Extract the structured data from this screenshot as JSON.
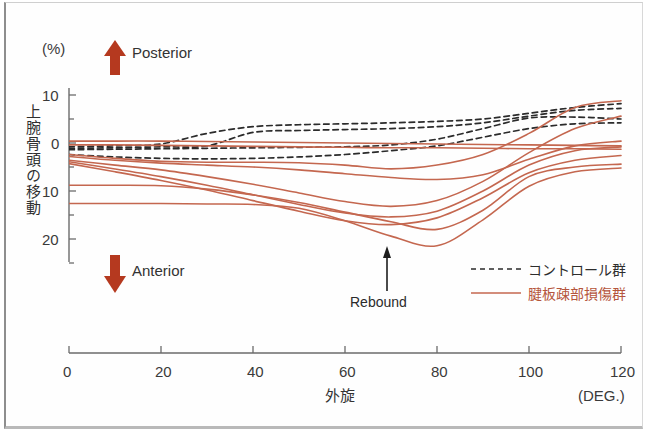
{
  "figure": {
    "unit_label": "(%)",
    "y_axis_title": "上腕骨頭の移動",
    "x_axis_title": "外旋",
    "x_unit_label": "(DEG.)",
    "direction_up_label": "Posterior",
    "direction_down_label": "Anterior",
    "annotation_label": "Rebound"
  },
  "legend": {
    "items": [
      {
        "label": "コントロール群",
        "style": "dashed",
        "color": "#333333"
      },
      {
        "label": "腱板疎部損傷群",
        "style": "solid",
        "color": "#c4674f"
      }
    ]
  },
  "colors": {
    "arrow_red": "#b5391f",
    "curve_red": "#c4674f",
    "control_dash": "#2b2b2b",
    "axis": "#6b6b6b"
  },
  "chart_data": {
    "type": "line",
    "title": "",
    "xlabel": "外旋",
    "ylabel": "上腕骨頭の移動",
    "x_unit": "(DEG.)",
    "y_unit": "(%)",
    "xlim": [
      0,
      120
    ],
    "ylim": [
      -25,
      15
    ],
    "xticks": [
      0,
      20,
      40,
      60,
      80,
      100,
      120
    ],
    "xticklabels": [
      "0",
      "20",
      "40",
      "60",
      "80",
      "100",
      "120"
    ],
    "yticks": [
      -20,
      -10,
      0,
      10
    ],
    "yticklabels": [
      "20",
      "10",
      "0",
      "10"
    ],
    "y_minor_ticks": [
      -25,
      -15,
      -5,
      5
    ],
    "grid": false,
    "legend_position": "bottom-right",
    "annotations": [
      {
        "text": "Rebound",
        "x": 68,
        "y": -22,
        "arrow": "up"
      },
      {
        "text": "Posterior",
        "x": 12,
        "y": 13,
        "arrow": "up"
      },
      {
        "text": "Anterior",
        "x": 12,
        "y": -19,
        "arrow": "down"
      }
    ],
    "x": [
      0,
      10,
      20,
      30,
      40,
      50,
      60,
      70,
      80,
      90,
      100,
      110,
      120
    ],
    "series": [
      {
        "name": "コントロール群 1",
        "group": "control",
        "style": "dashed",
        "color": "#2b2b2b",
        "values": [
          -0.8,
          -0.6,
          -0.2,
          2.0,
          3.4,
          3.8,
          4.0,
          4.2,
          4.5,
          5.0,
          6.2,
          7.4,
          8.2
        ]
      },
      {
        "name": "コントロール群 2",
        "group": "control",
        "style": "dashed",
        "color": "#2b2b2b",
        "values": [
          -1.1,
          -1.0,
          -0.8,
          -0.6,
          2.2,
          2.6,
          2.8,
          3.0,
          3.4,
          4.2,
          5.6,
          6.8,
          7.2
        ]
      },
      {
        "name": "コントロール群 3",
        "group": "control",
        "style": "dashed",
        "color": "#2b2b2b",
        "values": [
          -1.4,
          -1.3,
          -1.2,
          -1.1,
          -1.0,
          -0.9,
          -0.8,
          -0.4,
          0.8,
          3.0,
          5.2,
          5.4,
          5.0
        ]
      },
      {
        "name": "コントロール群 4",
        "group": "control",
        "style": "dashed",
        "color": "#2b2b2b",
        "values": [
          -2.4,
          -2.9,
          -3.2,
          -3.3,
          -3.2,
          -2.9,
          -2.4,
          -1.6,
          -0.6,
          1.2,
          3.0,
          4.0,
          4.2
        ]
      },
      {
        "name": "腱板疎部損傷群 1",
        "group": "injury",
        "style": "solid",
        "color": "#c4674f",
        "values": [
          0.4,
          0.4,
          0.4,
          0.3,
          0.2,
          0.1,
          0.0,
          -0.1,
          -0.2,
          -0.3,
          -0.4,
          -0.5,
          -0.6
        ]
      },
      {
        "name": "腱板疎部損傷群 2",
        "group": "injury",
        "style": "solid",
        "color": "#c4674f",
        "values": [
          -0.4,
          -0.4,
          -0.5,
          -0.6,
          -0.7,
          -0.8,
          -0.9,
          -1.0,
          -1.0,
          -1.1,
          -1.2,
          -1.2,
          -1.3
        ]
      },
      {
        "name": "腱板疎部損傷群 3",
        "group": "injury",
        "style": "solid",
        "color": "#c4674f",
        "values": [
          -2.4,
          -3.2,
          -3.8,
          -4.0,
          -4.0,
          -4.1,
          -4.6,
          -5.4,
          -4.6,
          -2.4,
          2.0,
          7.4,
          8.8
        ]
      },
      {
        "name": "腱板疎部損傷群 4",
        "group": "injury",
        "style": "solid",
        "color": "#c4674f",
        "values": [
          -3.6,
          -4.6,
          -5.6,
          -7.0,
          -8.6,
          -10.4,
          -12.2,
          -13.2,
          -12.0,
          -8.0,
          -2.0,
          3.0,
          5.6
        ]
      },
      {
        "name": "腱板疎部損傷群 5",
        "group": "injury",
        "style": "solid",
        "color": "#c4674f",
        "values": [
          -3.9,
          -5.4,
          -7.0,
          -8.8,
          -10.8,
          -12.8,
          -14.6,
          -15.4,
          -14.2,
          -10.0,
          -4.6,
          -1.6,
          -0.8
        ]
      },
      {
        "name": "腱板疎部損傷群 6",
        "group": "injury",
        "style": "solid",
        "color": "#c4674f",
        "values": [
          -4.3,
          -6.0,
          -7.8,
          -9.8,
          -12.0,
          -14.2,
          -16.2,
          -17.0,
          -15.6,
          -11.4,
          -6.2,
          -3.6,
          -2.6
        ]
      },
      {
        "name": "腱板疎部損傷群 7",
        "group": "injury",
        "style": "solid",
        "color": "#c4674f",
        "values": [
          -8.8,
          -8.8,
          -8.9,
          -9.6,
          -10.8,
          -12.4,
          -14.4,
          -16.4,
          -18.0,
          -14.0,
          -7.0,
          -5.0,
          -4.4
        ]
      },
      {
        "name": "腱板疎部損傷群 8",
        "group": "injury",
        "style": "solid",
        "color": "#c4674f",
        "values": [
          -12.6,
          -12.6,
          -12.6,
          -12.7,
          -12.8,
          -13.6,
          -16.2,
          -19.4,
          -21.4,
          -16.0,
          -9.0,
          -6.0,
          -5.2
        ]
      },
      {
        "name": "腱板疎部損傷群 9",
        "group": "injury",
        "style": "solid",
        "color": "#c4674f",
        "values": [
          -2.8,
          -3.6,
          -4.2,
          -4.6,
          -5.0,
          -5.6,
          -6.4,
          -7.2,
          -7.6,
          -6.6,
          -3.4,
          -0.6,
          0.4
        ]
      }
    ]
  }
}
